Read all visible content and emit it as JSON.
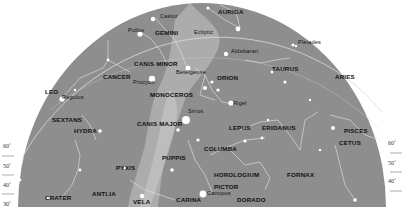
{
  "chart": {
    "type": "star-map",
    "colors": {
      "background": "#ffffff",
      "sky": "#8e8e8e",
      "milky_way": "#b4b4b4",
      "lines": "#e8e8e8",
      "stars": "#ffffff",
      "text": "#111111"
    },
    "constellations": [
      {
        "name": "AURIGA",
        "x": 218,
        "y": 12
      },
      {
        "name": "GEMINI",
        "x": 155,
        "y": 33
      },
      {
        "name": "CANIS MINOR",
        "x": 134,
        "y": 64
      },
      {
        "name": "CANCER",
        "x": 103,
        "y": 77
      },
      {
        "name": "ORION",
        "x": 217,
        "y": 78
      },
      {
        "name": "TAURUS",
        "x": 272,
        "y": 69
      },
      {
        "name": "ARIES",
        "x": 335,
        "y": 77
      },
      {
        "name": "LEO",
        "x": 45,
        "y": 92
      },
      {
        "name": "MONOCEROS",
        "x": 150,
        "y": 95
      },
      {
        "name": "SEXTANS",
        "x": 52,
        "y": 120
      },
      {
        "name": "HYDRA",
        "x": 74,
        "y": 131
      },
      {
        "name": "CANIS MAJOR",
        "x": 137,
        "y": 124
      },
      {
        "name": "LEPUS",
        "x": 229,
        "y": 128
      },
      {
        "name": "ERIDANUS",
        "x": 262,
        "y": 128
      },
      {
        "name": "PISCES",
        "x": 344,
        "y": 131
      },
      {
        "name": "CETUS",
        "x": 339,
        "y": 143
      },
      {
        "name": "COLUMBA",
        "x": 204,
        "y": 149
      },
      {
        "name": "PUPPIS",
        "x": 162,
        "y": 158
      },
      {
        "name": "PYXIS",
        "x": 116,
        "y": 168
      },
      {
        "name": "HOROLOGIUM",
        "x": 214,
        "y": 175
      },
      {
        "name": "FORNAX",
        "x": 287,
        "y": 175
      },
      {
        "name": "PICTOR",
        "x": 214,
        "y": 187
      },
      {
        "name": "ANTLIA",
        "x": 92,
        "y": 194
      },
      {
        "name": "DORADO",
        "x": 237,
        "y": 200
      },
      {
        "name": "CRATER",
        "x": 45,
        "y": 198
      },
      {
        "name": "VELA",
        "x": 133,
        "y": 202
      },
      {
        "name": "CARINA",
        "x": 176,
        "y": 200
      }
    ],
    "stars": [
      {
        "name": "Castor",
        "x": 160,
        "y": 17
      },
      {
        "name": "Pollux",
        "x": 128,
        "y": 31
      },
      {
        "name": "Ecliptic",
        "x": 194,
        "y": 33
      },
      {
        "name": "Aldebaran",
        "x": 231,
        "y": 52
      },
      {
        "name": "Pleiades",
        "x": 298,
        "y": 43
      },
      {
        "name": "Betelgeuse",
        "x": 176,
        "y": 73
      },
      {
        "name": "Procyon",
        "x": 133,
        "y": 83
      },
      {
        "name": "Regulus",
        "x": 62,
        "y": 98
      },
      {
        "name": "Rigel",
        "x": 233,
        "y": 104
      },
      {
        "name": "Sirius",
        "x": 188,
        "y": 112
      },
      {
        "name": "Canopus",
        "x": 207,
        "y": 194
      }
    ],
    "altitude_ticks": {
      "left": [
        {
          "label": "60˚",
          "y": 147
        },
        {
          "label": "50˚",
          "y": 167
        },
        {
          "label": "40˚",
          "y": 186
        },
        {
          "label": "30˚",
          "y": 205
        }
      ],
      "right": [
        {
          "label": "60˚",
          "y": 144
        },
        {
          "label": "50˚",
          "y": 164
        },
        {
          "label": "40˚",
          "y": 182
        }
      ]
    }
  }
}
